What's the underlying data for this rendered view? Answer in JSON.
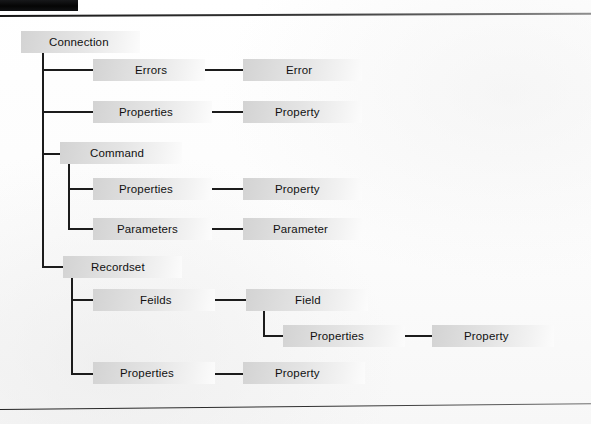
{
  "page": {
    "header_bar_label": "",
    "background_color": "#fdfdfd",
    "rule_color": "#2b2b2b",
    "node_fill_from": "#d3d3d3",
    "node_fill_to": "#fcfcfc",
    "text_color": "#111111",
    "edge_color": "#1c1c1c"
  },
  "diagram": {
    "type": "tree",
    "root": "Connection",
    "nodes": [
      {
        "id": "connection",
        "label": "Connection",
        "level": 0,
        "x": 21,
        "y": 31,
        "w": 119,
        "label_x": 28
      },
      {
        "id": "errors",
        "label": "Errors",
        "level": 1,
        "x": 93,
        "y": 59,
        "w": 112,
        "label_x": 42
      },
      {
        "id": "error",
        "label": "Error",
        "level": 2,
        "x": 243,
        "y": 59,
        "w": 119,
        "label_x": 43
      },
      {
        "id": "conn-properties",
        "label": "Properties",
        "level": 1,
        "x": 93,
        "y": 101,
        "w": 119,
        "label_x": 26
      },
      {
        "id": "conn-property",
        "label": "Property",
        "level": 2,
        "x": 243,
        "y": 101,
        "w": 119,
        "label_x": 32
      },
      {
        "id": "command",
        "label": "Command",
        "level": 1,
        "x": 60,
        "y": 142,
        "w": 122,
        "label_x": 30
      },
      {
        "id": "cmd-properties",
        "label": "Properties",
        "level": 2,
        "x": 93,
        "y": 178,
        "w": 119,
        "label_x": 26
      },
      {
        "id": "cmd-property",
        "label": "Property",
        "level": 3,
        "x": 243,
        "y": 178,
        "w": 119,
        "label_x": 32
      },
      {
        "id": "parameters",
        "label": "Parameters",
        "level": 2,
        "x": 93,
        "y": 218,
        "w": 119,
        "label_x": 24
      },
      {
        "id": "parameter",
        "label": "Parameter",
        "level": 3,
        "x": 243,
        "y": 218,
        "w": 119,
        "label_x": 30
      },
      {
        "id": "recordset",
        "label": "Recordset",
        "level": 1,
        "x": 63,
        "y": 256,
        "w": 119,
        "label_x": 28
      },
      {
        "id": "feilds",
        "label": "Feilds",
        "level": 2,
        "x": 93,
        "y": 289,
        "w": 122,
        "label_x": 47
      },
      {
        "id": "field",
        "label": "Field",
        "level": 3,
        "x": 246,
        "y": 289,
        "w": 122,
        "label_x": 49
      },
      {
        "id": "field-properties",
        "label": "Properties",
        "level": 4,
        "x": 283,
        "y": 325,
        "w": 122,
        "label_x": 27
      },
      {
        "id": "field-property",
        "label": "Property",
        "level": 5,
        "x": 432,
        "y": 325,
        "w": 122,
        "label_x": 32
      },
      {
        "id": "rs-properties",
        "label": "Properties",
        "level": 2,
        "x": 93,
        "y": 362,
        "w": 122,
        "label_x": 27
      },
      {
        "id": "rs-property",
        "label": "Property",
        "level": 3,
        "x": 243,
        "y": 362,
        "w": 122,
        "label_x": 32
      }
    ],
    "edges": [
      {
        "from": "connection",
        "to": "errors",
        "kind": "elbow"
      },
      {
        "from": "connection",
        "to": "conn-properties",
        "kind": "elbow"
      },
      {
        "from": "connection",
        "to": "command",
        "kind": "elbow"
      },
      {
        "from": "connection",
        "to": "recordset",
        "kind": "elbow"
      },
      {
        "from": "errors",
        "to": "error",
        "kind": "straight"
      },
      {
        "from": "conn-properties",
        "to": "conn-property",
        "kind": "straight"
      },
      {
        "from": "command",
        "to": "cmd-properties",
        "kind": "elbow"
      },
      {
        "from": "command",
        "to": "parameters",
        "kind": "elbow"
      },
      {
        "from": "cmd-properties",
        "to": "cmd-property",
        "kind": "straight"
      },
      {
        "from": "parameters",
        "to": "parameter",
        "kind": "straight"
      },
      {
        "from": "recordset",
        "to": "feilds",
        "kind": "elbow"
      },
      {
        "from": "recordset",
        "to": "rs-properties",
        "kind": "elbow"
      },
      {
        "from": "feilds",
        "to": "field",
        "kind": "straight"
      },
      {
        "from": "field",
        "to": "field-properties",
        "kind": "elbow"
      },
      {
        "from": "field-properties",
        "to": "field-property",
        "kind": "straight"
      },
      {
        "from": "rs-properties",
        "to": "rs-property",
        "kind": "straight"
      }
    ]
  }
}
